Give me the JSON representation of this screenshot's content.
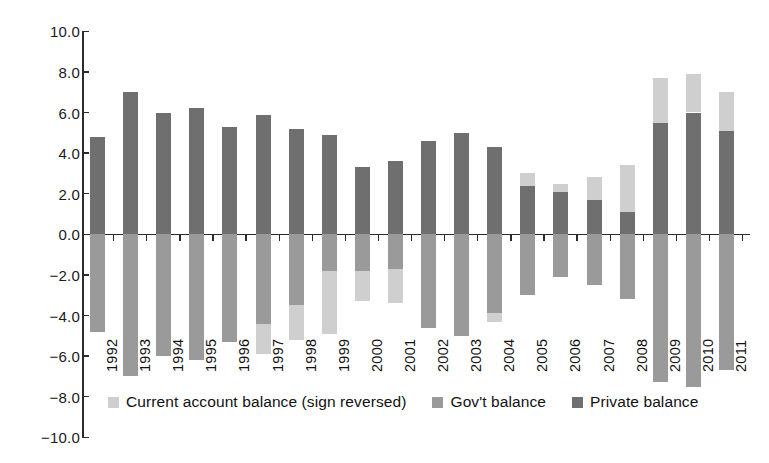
{
  "chart_data": {
    "type": "bar",
    "stacked": true,
    "title": "",
    "xlabel": "",
    "ylabel": "",
    "ylim": [
      -10.0,
      10.0
    ],
    "ytick_labels": [
      "10.0",
      "8.0",
      "6.0",
      "4.0",
      "2.0",
      "0.0",
      "−2.0",
      "−4.0",
      "−6.0",
      "−8.0",
      "−10.0"
    ],
    "ytick_values": [
      10.0,
      8.0,
      6.0,
      4.0,
      2.0,
      0.0,
      -2.0,
      -4.0,
      -6.0,
      -8.0,
      -10.0
    ],
    "grid": false,
    "legend_position": "bottom",
    "categories": [
      "1992",
      "1993",
      "1994",
      "1995",
      "1996",
      "1997",
      "1998",
      "1999",
      "2000",
      "2001",
      "2002",
      "2003",
      "2004",
      "2005",
      "2006",
      "2007",
      "2008",
      "2009",
      "2010",
      "2011"
    ],
    "series": [
      {
        "name": "Private balance",
        "color": "#6f6f6f",
        "values": [
          4.8,
          7.0,
          6.0,
          6.2,
          5.3,
          5.9,
          5.2,
          4.9,
          3.3,
          3.6,
          4.6,
          5.0,
          4.3,
          2.4,
          2.1,
          1.7,
          1.1,
          5.5,
          6.0,
          5.1
        ]
      },
      {
        "name": "Gov't balance",
        "color": "#9a9a9a",
        "values": [
          -4.8,
          -7.0,
          -6.0,
          -6.2,
          -5.3,
          -4.4,
          -3.5,
          -1.8,
          -1.8,
          -1.7,
          -4.6,
          -5.0,
          -3.9,
          -3.0,
          -2.1,
          -2.5,
          -3.2,
          -7.3,
          -7.5,
          -6.7
        ]
      },
      {
        "name": "Current account balance (sign reversed)",
        "color": "#cfcfcf",
        "values": [
          0.0,
          0.0,
          0.0,
          0.0,
          0.0,
          -1.5,
          -1.7,
          -3.1,
          -1.5,
          -1.7,
          0.0,
          0.0,
          -0.4,
          0.6,
          0.4,
          1.1,
          2.3,
          2.2,
          1.9,
          1.9
        ]
      }
    ],
    "stack_notes": {
      "positive_bottom": "Private balance",
      "positive_top": "Current account balance (sign reversed)",
      "negative": "Gov't balance then Current account balance (sign reversed)"
    }
  },
  "legend": {
    "items": [
      {
        "label": "Current account balance (sign reversed)",
        "swatch": "sw-ca"
      },
      {
        "label": "Gov't balance",
        "swatch": "sw-govt"
      },
      {
        "label": "Private balance",
        "swatch": "sw-private"
      }
    ]
  }
}
